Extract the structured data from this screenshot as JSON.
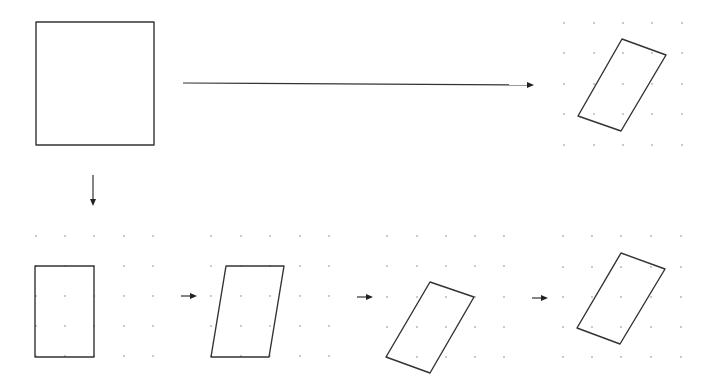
{
  "diagram": {
    "colors": {
      "stroke": "#333333",
      "grid_dot": "#b0b0b0",
      "background": "#ffffff"
    },
    "original_square": {
      "points": [
        [
          36,
          22
        ],
        [
          154,
          22
        ],
        [
          154,
          145
        ],
        [
          36,
          145
        ]
      ]
    },
    "direct_arrow": {
      "from": [
        183,
        83
      ],
      "to": [
        534,
        85
      ]
    },
    "down_arrow": {
      "from": [
        93,
        175
      ],
      "to": [
        93,
        206
      ]
    },
    "top_result": {
      "grid": {
        "xs": [
          564,
          594,
          623,
          652,
          682
        ],
        "ys": [
          23,
          53,
          84,
          114,
          145
        ]
      },
      "points": [
        [
          622,
          39
        ],
        [
          666,
          55
        ],
        [
          621,
          131
        ],
        [
          578,
          116
        ]
      ]
    },
    "steps": [
      {
        "name": "scaled-rectangle",
        "grid": {
          "xs": [
            36,
            65,
            94,
            124,
            153
          ],
          "ys": [
            236,
            266,
            296,
            326,
            356
          ]
        },
        "points": [
          [
            35,
            266
          ],
          [
            94,
            266
          ],
          [
            94,
            357
          ],
          [
            35,
            357
          ]
        ]
      },
      {
        "name": "sheared",
        "grid": {
          "xs": [
            211,
            241,
            270,
            300,
            329
          ],
          "ys": [
            236,
            266,
            296,
            326,
            356
          ]
        },
        "points": [
          [
            226,
            266
          ],
          [
            284,
            266
          ],
          [
            269,
            357
          ],
          [
            211,
            357
          ]
        ]
      },
      {
        "name": "rotated",
        "grid": {
          "xs": [
            387,
            417,
            446,
            475,
            504
          ],
          "ys": [
            236,
            266,
            297,
            327,
            357
          ]
        },
        "points": [
          [
            430,
            282
          ],
          [
            474,
            297
          ],
          [
            430,
            373
          ],
          [
            386,
            357
          ]
        ]
      },
      {
        "name": "final",
        "grid": {
          "xs": [
            563,
            592,
            621,
            651,
            681
          ],
          "ys": [
            236,
            267,
            297,
            327,
            357
          ]
        },
        "points": [
          [
            621,
            253
          ],
          [
            665,
            269
          ],
          [
            620,
            344
          ],
          [
            577,
            328
          ]
        ]
      }
    ],
    "step_arrows": [
      {
        "from": [
          181,
          296
        ],
        "to": [
          197,
          296
        ]
      },
      {
        "from": [
          357,
          297
        ],
        "to": [
          373,
          297
        ]
      },
      {
        "from": [
          532,
          298
        ],
        "to": [
          548,
          298
        ]
      }
    ]
  }
}
